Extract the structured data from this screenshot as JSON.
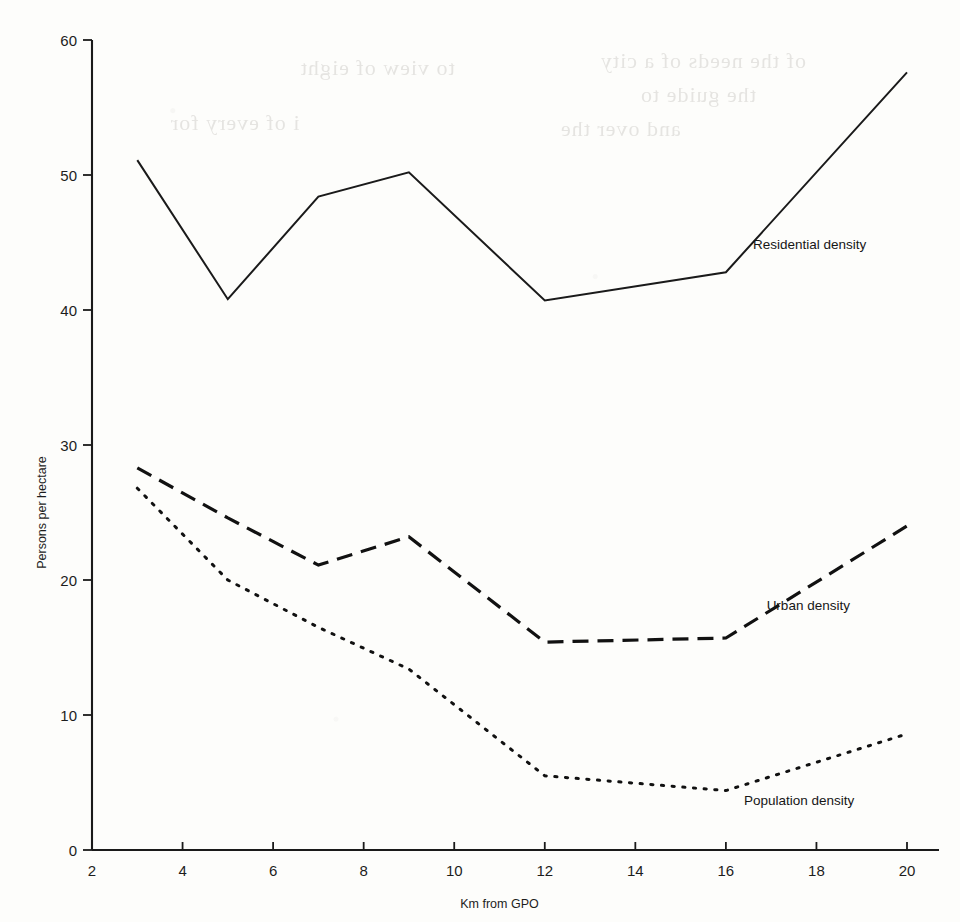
{
  "page": {
    "background_color": "#fdfdfb",
    "ink_color": "#1a1a1a",
    "ghost_text": [
      "of the needs of a city",
      "the guide to",
      "and over the",
      "to view of eight",
      "i of every for"
    ]
  },
  "chart_data": {
    "type": "line",
    "title": "",
    "xlabel": "Km from GPO",
    "ylabel": "Persons per hectare",
    "xlim": [
      2,
      20.6
    ],
    "ylim": [
      0,
      60
    ],
    "grid": false,
    "legend_position": "inline-right-of-series",
    "x_ticks": [
      2,
      4,
      6,
      8,
      10,
      12,
      14,
      16,
      18,
      20
    ],
    "y_ticks": [
      0,
      10,
      20,
      30,
      40,
      50,
      60
    ],
    "x": [
      3,
      5,
      7,
      9,
      12,
      16,
      20
    ],
    "series": [
      {
        "name": "Residential density",
        "style": "solid",
        "values": [
          51.1,
          40.8,
          48.4,
          50.2,
          40.7,
          42.8,
          57.6
        ],
        "label_x": 16.6,
        "label_y": 44.5
      },
      {
        "name": "Urban density",
        "style": "dashed",
        "values": [
          28.3,
          24.6,
          21.1,
          23.2,
          15.4,
          15.7,
          24.0
        ],
        "label_x": 16.9,
        "label_y": 17.8
      },
      {
        "name": "Population density",
        "style": "dotted",
        "values": [
          26.8,
          20.0,
          16.5,
          13.4,
          5.5,
          4.4,
          8.6
        ],
        "label_x": 16.4,
        "label_y": 3.3
      }
    ]
  },
  "axes": {
    "y_tick_labels": [
      "60",
      "50",
      "40",
      "30",
      "20",
      "10",
      "0"
    ],
    "x_tick_labels": [
      "2",
      "4",
      "6",
      "8",
      "10",
      "12",
      "14",
      "16",
      "18",
      "20"
    ],
    "y_axis_title": "Persons per hectare",
    "x_axis_title": "Km from GPO"
  }
}
